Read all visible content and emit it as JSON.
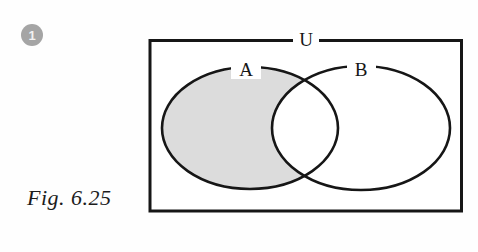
{
  "badge": {
    "label": "1",
    "color": "#a5a5a5"
  },
  "caption": {
    "text": "Fig. 6.25"
  },
  "diagram": {
    "universe_label": "U",
    "set_a_label": "A",
    "set_b_label": "B",
    "shaded_region": "A minus B",
    "shade_color": "#dcdcdc",
    "line_color": "#161616",
    "background_color": "#ffffff"
  }
}
